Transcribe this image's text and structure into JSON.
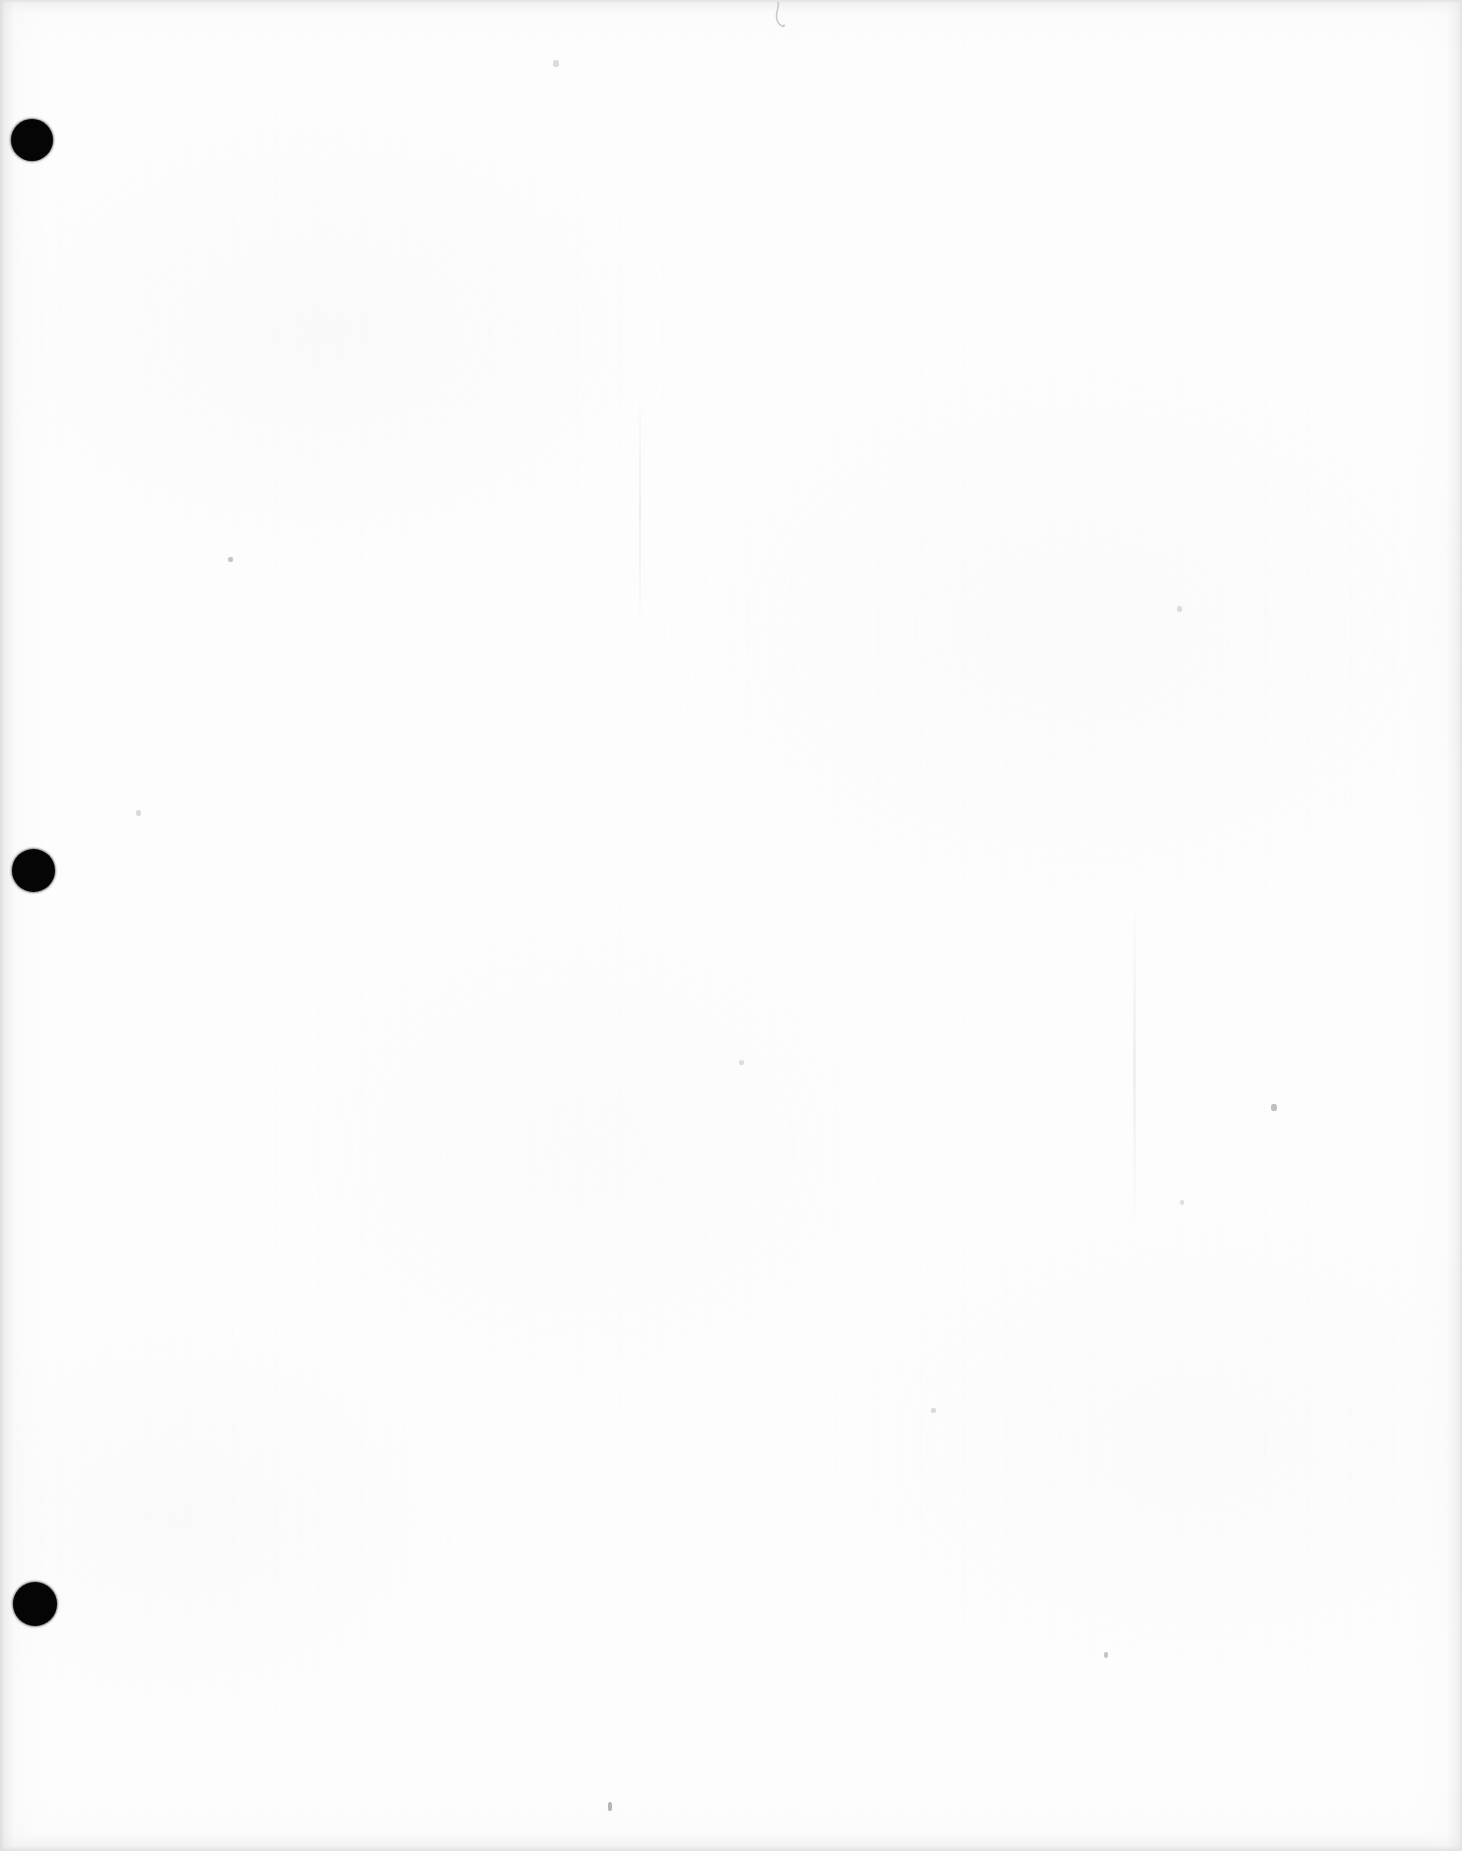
{
  "document": {
    "kind": "scanned-page",
    "page_state": "blank",
    "page_content_text": "",
    "orientation": "portrait",
    "width_px": 1462,
    "height_px": 1851,
    "background_color": "#fdfdfd",
    "ink_color": "#050505",
    "edge_shadow_color": "#e2e2e5"
  },
  "binder_holes": {
    "count": 3,
    "color": "#050505",
    "shape": "circle",
    "items": [
      {
        "label": "top punch hole",
        "x": 11,
        "y": 119,
        "diameter": 42
      },
      {
        "label": "middle punch hole",
        "x": 12,
        "y": 849,
        "diameter": 43
      },
      {
        "label": "bottom punch hole",
        "x": 13,
        "y": 1582,
        "diameter": 44
      }
    ]
  },
  "artifacts": {
    "pencil_mark": {
      "label": "faint pencil squiggle",
      "x": 770,
      "y": 2,
      "width": 22,
      "height": 30,
      "color": "#c9c9ce"
    },
    "specks": [
      {
        "label": "speck-upper-left",
        "x": 228,
        "y": 557,
        "w": 5,
        "h": 5,
        "color": "#c4c4c8"
      },
      {
        "label": "speck-upper-mid",
        "x": 553,
        "y": 60,
        "w": 6,
        "h": 7,
        "color": "#dcdce0"
      },
      {
        "label": "speck-mid-right",
        "x": 1271,
        "y": 1104,
        "w": 6,
        "h": 7,
        "color": "#bfbfc4"
      },
      {
        "label": "speck-lower-mid",
        "x": 608,
        "y": 1802,
        "w": 4,
        "h": 9,
        "color": "#b5b5ba"
      },
      {
        "label": "speck-lower-right",
        "x": 1104,
        "y": 1652,
        "w": 4,
        "h": 6,
        "color": "#c2c2c7"
      },
      {
        "label": "speck-mid-left",
        "x": 136,
        "y": 810,
        "w": 5,
        "h": 6,
        "color": "#dadade"
      },
      {
        "label": "speck-mid-center",
        "x": 739,
        "y": 1060,
        "w": 5,
        "h": 5,
        "color": "#dddde1"
      },
      {
        "label": "speck-center-low",
        "x": 931,
        "y": 1408,
        "w": 5,
        "h": 5,
        "color": "#d9d9dd"
      },
      {
        "label": "speck-right-mid",
        "x": 1180,
        "y": 1200,
        "w": 4,
        "h": 5,
        "color": "#dedee2"
      },
      {
        "label": "speck-right-upper",
        "x": 1177,
        "y": 606,
        "w": 5,
        "h": 6,
        "color": "#dbdbdf"
      }
    ],
    "streaks": [
      {
        "label": "paper-fold-streak-right",
        "x": 1133,
        "y": 900,
        "w": 3,
        "h": 330
      },
      {
        "label": "paper-fold-streak-mid",
        "x": 639,
        "y": 380,
        "w": 2,
        "h": 260
      }
    ]
  },
  "accessibility": {
    "page_title": "Scanned blank page with three binder punch holes"
  }
}
